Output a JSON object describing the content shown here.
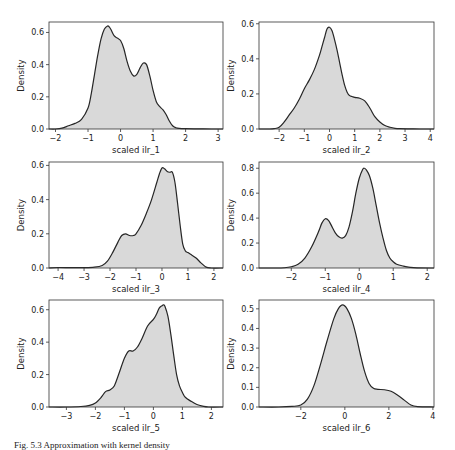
{
  "figure": {
    "caption": "Fig. 5.3  Approximation with kernel density"
  },
  "chart_data": [
    {
      "type": "area",
      "subtype": "kde",
      "xlabel": "scaled ilr_1",
      "ylabel": "Density",
      "xlim": [
        -2.2,
        3.15
      ],
      "ylim": [
        0,
        0.665
      ],
      "xticks": [
        -2,
        -1,
        0,
        1,
        2,
        3
      ],
      "yticks": [
        0.0,
        0.2,
        0.4,
        0.6
      ],
      "ytick_labels": [
        "0.0",
        "0.2",
        "0.4",
        "0.6"
      ],
      "frame": {
        "left": 49,
        "top": 22,
        "right": 223,
        "bottom": 129
      },
      "x": [
        -2.2,
        -2.0,
        -1.8,
        -1.6,
        -1.4,
        -1.2,
        -1.0,
        -0.9,
        -0.8,
        -0.7,
        -0.6,
        -0.5,
        -0.4,
        -0.35,
        -0.3,
        -0.2,
        -0.1,
        0.0,
        0.1,
        0.2,
        0.3,
        0.4,
        0.5,
        0.6,
        0.7,
        0.8,
        0.9,
        1.0,
        1.1,
        1.2,
        1.3,
        1.4,
        1.5,
        1.6,
        1.7,
        1.8,
        2.0,
        2.4,
        2.8,
        3.15
      ],
      "y": [
        0.0,
        0.0,
        0.005,
        0.02,
        0.035,
        0.06,
        0.13,
        0.22,
        0.34,
        0.46,
        0.56,
        0.62,
        0.64,
        0.635,
        0.62,
        0.58,
        0.565,
        0.55,
        0.5,
        0.42,
        0.36,
        0.33,
        0.34,
        0.38,
        0.41,
        0.4,
        0.33,
        0.24,
        0.17,
        0.14,
        0.12,
        0.09,
        0.05,
        0.02,
        0.008,
        0.004,
        0.002,
        0.001,
        0.0,
        0.0
      ]
    },
    {
      "type": "area",
      "subtype": "kde",
      "xlabel": "scaled ilr_2",
      "ylabel": "Density",
      "xlim": [
        -2.8,
        4.15
      ],
      "ylim": [
        0,
        0.61
      ],
      "xticks": [
        -2,
        -1,
        0,
        1,
        2,
        3,
        4
      ],
      "yticks": [
        0.0,
        0.2,
        0.4,
        0.6
      ],
      "ytick_labels": [
        "0.0",
        "0.2",
        "0.4",
        "0.6"
      ],
      "frame": {
        "left": 259,
        "top": 22,
        "right": 434,
        "bottom": 129
      },
      "x": [
        -2.8,
        -2.4,
        -2.2,
        -2.0,
        -1.8,
        -1.6,
        -1.4,
        -1.2,
        -1.0,
        -0.8,
        -0.6,
        -0.4,
        -0.3,
        -0.2,
        -0.1,
        0.0,
        0.1,
        0.2,
        0.3,
        0.4,
        0.5,
        0.6,
        0.7,
        0.8,
        0.9,
        1.0,
        1.2,
        1.4,
        1.6,
        1.8,
        2.0,
        2.2,
        2.4,
        2.6,
        2.8,
        3.2,
        3.6,
        4.15
      ],
      "y": [
        0.0,
        0.0,
        0.002,
        0.01,
        0.04,
        0.08,
        0.12,
        0.17,
        0.23,
        0.28,
        0.34,
        0.42,
        0.47,
        0.52,
        0.57,
        0.58,
        0.56,
        0.51,
        0.45,
        0.38,
        0.31,
        0.25,
        0.21,
        0.19,
        0.185,
        0.18,
        0.175,
        0.16,
        0.12,
        0.07,
        0.04,
        0.02,
        0.01,
        0.004,
        0.002,
        0.001,
        0.0,
        0.0
      ]
    },
    {
      "type": "area",
      "subtype": "kde",
      "xlabel": "scaled ilr_3",
      "ylabel": "Density",
      "xlim": [
        -4.35,
        2.35
      ],
      "ylim": [
        0,
        0.62
      ],
      "xticks": [
        -4,
        -3,
        -2,
        -1,
        0,
        1,
        2
      ],
      "yticks": [
        0.0,
        0.2,
        0.4,
        0.6
      ],
      "ytick_labels": [
        "0.0",
        "0.2",
        "0.4",
        "0.6"
      ],
      "frame": {
        "left": 49,
        "top": 162,
        "right": 223,
        "bottom": 268
      },
      "x": [
        -4.35,
        -4.0,
        -3.5,
        -3.0,
        -2.6,
        -2.3,
        -2.1,
        -1.9,
        -1.7,
        -1.55,
        -1.4,
        -1.25,
        -1.1,
        -1.0,
        -0.8,
        -0.6,
        -0.4,
        -0.2,
        -0.1,
        0.0,
        0.1,
        0.2,
        0.3,
        0.4,
        0.5,
        0.6,
        0.7,
        0.8,
        0.9,
        1.0,
        1.1,
        1.3,
        1.5,
        1.7,
        1.9,
        2.35
      ],
      "y": [
        0.0,
        0.003,
        0.002,
        0.002,
        0.005,
        0.015,
        0.04,
        0.09,
        0.15,
        0.19,
        0.2,
        0.19,
        0.19,
        0.2,
        0.25,
        0.32,
        0.4,
        0.5,
        0.55,
        0.585,
        0.58,
        0.565,
        0.56,
        0.56,
        0.5,
        0.38,
        0.25,
        0.14,
        0.1,
        0.09,
        0.08,
        0.06,
        0.03,
        0.005,
        0.0,
        0.0
      ]
    },
    {
      "type": "area",
      "subtype": "kde",
      "xlabel": "scaled ilr_4",
      "ylabel": "Density",
      "xlim": [
        -2.95,
        2.2
      ],
      "ylim": [
        0,
        0.85
      ],
      "xticks": [
        -2,
        -1,
        0,
        1,
        2
      ],
      "yticks": [
        0.0,
        0.2,
        0.4,
        0.6,
        0.8
      ],
      "ytick_labels": [
        "0.0",
        "0.2",
        "0.4",
        "0.6",
        "0.8"
      ],
      "frame": {
        "left": 259,
        "top": 162,
        "right": 434,
        "bottom": 268
      },
      "x": [
        -2.95,
        -2.5,
        -2.2,
        -2.0,
        -1.8,
        -1.6,
        -1.4,
        -1.2,
        -1.1,
        -1.0,
        -0.9,
        -0.8,
        -0.7,
        -0.6,
        -0.5,
        -0.4,
        -0.3,
        -0.2,
        -0.1,
        0.0,
        0.1,
        0.15,
        0.2,
        0.3,
        0.4,
        0.5,
        0.6,
        0.7,
        0.8,
        0.9,
        1.0,
        1.1,
        1.3,
        1.5,
        1.7,
        2.2
      ],
      "y": [
        0.0,
        0.0,
        0.002,
        0.01,
        0.03,
        0.08,
        0.17,
        0.29,
        0.36,
        0.395,
        0.38,
        0.33,
        0.28,
        0.25,
        0.24,
        0.26,
        0.33,
        0.45,
        0.6,
        0.72,
        0.79,
        0.8,
        0.79,
        0.74,
        0.64,
        0.5,
        0.36,
        0.24,
        0.14,
        0.08,
        0.05,
        0.03,
        0.015,
        0.005,
        0.001,
        0.0
      ]
    },
    {
      "type": "area",
      "subtype": "kde",
      "xlabel": "scaled ilr_5",
      "ylabel": "Density",
      "xlim": [
        -3.6,
        2.4
      ],
      "ylim": [
        0,
        0.66
      ],
      "xticks": [
        -3,
        -2,
        -1,
        0,
        1,
        2
      ],
      "yticks": [
        0.0,
        0.2,
        0.4,
        0.6
      ],
      "ytick_labels": [
        "0.0",
        "0.2",
        "0.4",
        "0.6"
      ],
      "frame": {
        "left": 49,
        "top": 300,
        "right": 223,
        "bottom": 407
      },
      "x": [
        -3.6,
        -3.0,
        -2.5,
        -2.2,
        -2.0,
        -1.8,
        -1.65,
        -1.5,
        -1.35,
        -1.2,
        -1.0,
        -0.85,
        -0.7,
        -0.55,
        -0.4,
        -0.2,
        0.0,
        0.1,
        0.2,
        0.3,
        0.35,
        0.4,
        0.5,
        0.6,
        0.7,
        0.8,
        0.9,
        1.0,
        1.1,
        1.3,
        1.5,
        1.7,
        1.9,
        2.4
      ],
      "y": [
        0.0,
        0.0,
        0.003,
        0.01,
        0.025,
        0.06,
        0.095,
        0.105,
        0.13,
        0.2,
        0.3,
        0.345,
        0.345,
        0.37,
        0.42,
        0.5,
        0.54,
        0.57,
        0.61,
        0.625,
        0.63,
        0.62,
        0.56,
        0.45,
        0.32,
        0.2,
        0.13,
        0.09,
        0.06,
        0.035,
        0.015,
        0.005,
        0.0,
        0.0
      ]
    },
    {
      "type": "area",
      "subtype": "kde",
      "xlabel": "scaled ilr_6",
      "ylabel": "Density",
      "xlim": [
        -3.9,
        4.05
      ],
      "ylim": [
        0,
        0.545
      ],
      "xticks": [
        -2,
        0,
        2,
        4
      ],
      "yticks": [
        0.0,
        0.1,
        0.2,
        0.3,
        0.4,
        0.5
      ],
      "ytick_labels": [
        "0.0",
        "0.1",
        "0.2",
        "0.3",
        "0.4",
        "0.5"
      ],
      "frame": {
        "left": 259,
        "top": 300,
        "right": 434,
        "bottom": 407
      },
      "x": [
        -3.9,
        -3.0,
        -2.4,
        -2.0,
        -1.7,
        -1.4,
        -1.1,
        -0.8,
        -0.5,
        -0.3,
        -0.1,
        0.1,
        0.3,
        0.5,
        0.7,
        0.9,
        1.1,
        1.3,
        1.5,
        1.8,
        2.1,
        2.4,
        2.7,
        3.0,
        3.3,
        4.05
      ],
      "y": [
        0.0,
        0.0,
        0.003,
        0.01,
        0.04,
        0.11,
        0.22,
        0.34,
        0.45,
        0.5,
        0.52,
        0.5,
        0.45,
        0.37,
        0.27,
        0.18,
        0.12,
        0.095,
        0.09,
        0.088,
        0.08,
        0.06,
        0.035,
        0.01,
        0.002,
        0.0
      ]
    }
  ]
}
